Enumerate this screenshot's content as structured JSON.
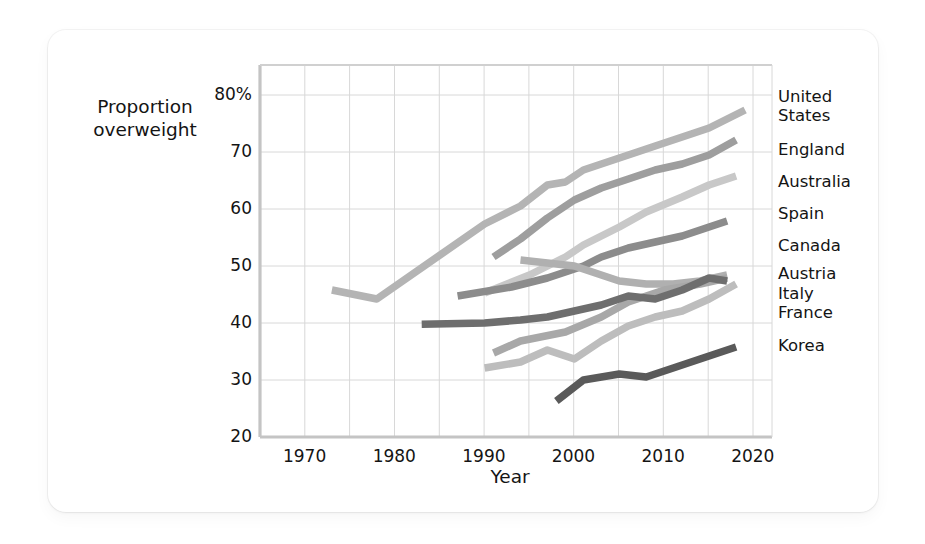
{
  "axes": {
    "ylabel_line1": "Proportion",
    "ylabel_line2": "overweight",
    "xlabel": "Year",
    "ytick_labels": [
      "80%",
      "70",
      "60",
      "50",
      "40",
      "30",
      "20"
    ],
    "xtick_labels": [
      "1970",
      "1980",
      "1990",
      "2000",
      "2010",
      "2020"
    ]
  },
  "legend": {
    "united_states_l1": "United",
    "united_states_l2": "States",
    "england": "England",
    "australia": "Australia",
    "spain": "Spain",
    "canada": "Canada",
    "austria": "Austria",
    "italy": "Italy",
    "france": "France",
    "korea": "Korea"
  },
  "chart_data": {
    "type": "line",
    "title": "",
    "xlabel": "Year",
    "ylabel": "Proportion overweight",
    "xlim": [
      1965,
      2022
    ],
    "ylim": [
      20,
      82
    ],
    "yticks": [
      20,
      30,
      40,
      50,
      60,
      70,
      80
    ],
    "xticks": [
      1970,
      1980,
      1990,
      2000,
      2010,
      2020
    ],
    "ytick_labels": [
      "20",
      "30",
      "40",
      "50",
      "60",
      "70",
      "80%"
    ],
    "grid": true,
    "grid_x_step": 5,
    "grid_y_step": 10,
    "legend_position": "right-inline",
    "units": "percent of adult population overweight (incl. obese)",
    "series": [
      {
        "name": "United States",
        "color": "#b4b4b4",
        "x": [
          1973,
          1978,
          1990,
          1994,
          1997,
          1999,
          2001,
          2003,
          2005,
          2007,
          2009,
          2011,
          2013,
          2015,
          2017,
          2019
        ],
        "y": [
          44.5,
          43.0,
          55.5,
          58.5,
          62.0,
          62.5,
          64.5,
          65.5,
          66.5,
          67.5,
          68.5,
          69.5,
          70.5,
          71.5,
          73.0,
          74.5
        ]
      },
      {
        "name": "England",
        "color": "#9e9e9e",
        "x": [
          1991,
          1994,
          1997,
          2000,
          2003,
          2006,
          2009,
          2012,
          2015,
          2018
        ],
        "y": [
          50.0,
          53.0,
          56.5,
          59.5,
          61.5,
          63.0,
          64.5,
          65.5,
          67.0,
          69.5
        ]
      },
      {
        "name": "Australia",
        "color": "#c8c8c8",
        "x": [
          1990,
          1995,
          1999,
          2001,
          2005,
          2008,
          2012,
          2015,
          2018
        ],
        "y": [
          44.0,
          47.0,
          50.0,
          52.0,
          55.0,
          57.5,
          60.0,
          62.0,
          63.5
        ]
      },
      {
        "name": "Spain",
        "color": "#8c8c8c",
        "x": [
          1987,
          1993,
          1997,
          2001,
          2003,
          2006,
          2009,
          2012,
          2015,
          2017
        ],
        "y": [
          43.5,
          45.0,
          46.5,
          48.5,
          50.0,
          51.5,
          52.5,
          53.5,
          55.0,
          56.0
        ]
      },
      {
        "name": "Canada",
        "color": "#b0b0b0",
        "x": [
          1994,
          1997,
          2000,
          2003,
          2005,
          2008,
          2011,
          2014,
          2017
        ],
        "y": [
          49.5,
          49.0,
          48.5,
          47.0,
          46.0,
          45.5,
          45.5,
          46.0,
          47.0
        ]
      },
      {
        "name": "Austria",
        "color": "#a8a8a8",
        "x": [
          1991,
          1994,
          1999,
          2003,
          2006,
          2010,
          2014,
          2017
        ],
        "y": [
          34.0,
          36.0,
          37.5,
          40.0,
          42.5,
          44.5,
          45.5,
          46.5
        ]
      },
      {
        "name": "Italy",
        "color": "#bdbdbd",
        "x": [
          1990,
          1994,
          1997,
          2000,
          2003,
          2006,
          2009,
          2012,
          2015,
          2018
        ],
        "y": [
          31.5,
          32.5,
          34.5,
          33.0,
          36.0,
          38.5,
          40.0,
          41.0,
          43.0,
          45.5
        ]
      },
      {
        "name": "France",
        "color": "#6e6e6e",
        "x": [
          1983,
          1990,
          1994,
          1997,
          2000,
          2003,
          2006,
          2009,
          2012,
          2015,
          2017
        ],
        "y": [
          38.8,
          39.0,
          39.5,
          40.0,
          41.0,
          42.0,
          43.5,
          43.0,
          44.5,
          46.5,
          46.0
        ]
      },
      {
        "name": "Korea",
        "color": "#5a5a5a",
        "x": [
          1998,
          2001,
          2005,
          2008,
          2011,
          2014,
          2018
        ],
        "y": [
          26.0,
          29.5,
          30.5,
          30.0,
          31.5,
          33.0,
          35.0
        ]
      }
    ]
  }
}
